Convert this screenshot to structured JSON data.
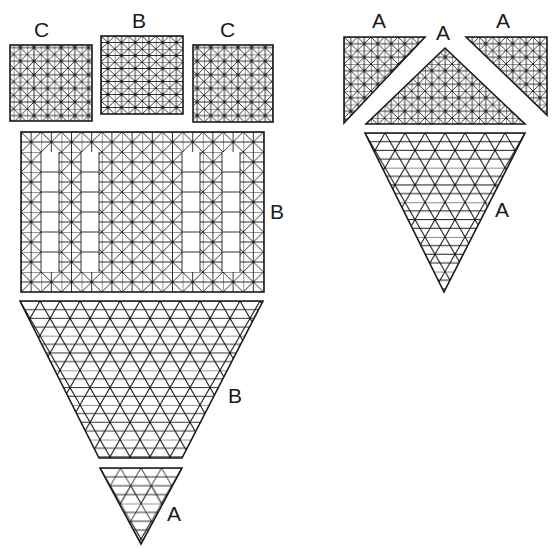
{
  "diagram": {
    "type": "grid-pattern pieces",
    "stroke_color": "#1a1a1a",
    "background": "#ffffff",
    "left_group": {
      "top_row": [
        {
          "label": "C",
          "shape": "square",
          "grid": "square-diagonal"
        },
        {
          "label": "B",
          "shape": "square",
          "grid": "square-diagonal"
        },
        {
          "label": "C",
          "shape": "square",
          "grid": "square-diagonal"
        }
      ],
      "rectangle": {
        "label": "B",
        "shape": "rectangle",
        "grid": "square-diagonal with open panels"
      },
      "trapezoid": {
        "label": "B",
        "shape": "inverted trapezoid",
        "grid": "triangular-star"
      },
      "small_triangle": {
        "label": "A",
        "shape": "inverted triangle",
        "grid": "triangular-star"
      }
    },
    "right_group": {
      "top_row": [
        {
          "label": "A",
          "shape": "right triangle (left)",
          "grid": "square-diagonal"
        },
        {
          "label": "A",
          "shape": "isosceles triangle (center)",
          "grid": "square-diagonal"
        },
        {
          "label": "A",
          "shape": "right triangle (right)",
          "grid": "square-diagonal"
        }
      ],
      "large_triangle": {
        "label": "A",
        "shape": "inverted triangle",
        "grid": "triangular-star"
      }
    }
  },
  "labels": {
    "c_left": "C",
    "b_top": "B",
    "c_right": "C",
    "b_rect": "B",
    "b_trap": "B",
    "a_small": "A",
    "a_tl": "A",
    "a_center": "A",
    "a_tr": "A",
    "a_big": "A"
  }
}
